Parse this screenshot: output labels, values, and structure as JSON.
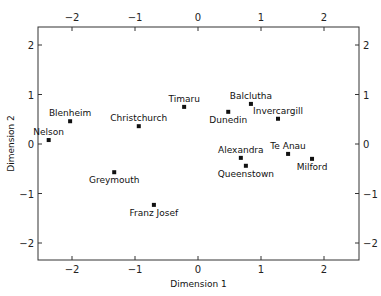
{
  "chart_data": {
    "type": "scatter",
    "title": "",
    "xlabel": "Dimension 1",
    "ylabel": "Dimension 2",
    "xlim": [
      -2.6,
      2.6
    ],
    "ylim": [
      -2.35,
      2.35
    ],
    "grid": false,
    "legend": null,
    "x_ticks": [
      -2,
      -1,
      0,
      1,
      2
    ],
    "y_ticks": [
      2,
      1,
      0,
      -1,
      -2
    ],
    "x_tick_labels": [
      "−2",
      "−1",
      "0",
      "1",
      "2"
    ],
    "y_tick_labels": [
      "2",
      "1",
      "0",
      "−1",
      "−2"
    ],
    "ticks_mirrored": true,
    "points": [
      {
        "label": "Nelson",
        "x": -2.37,
        "y": 0.08,
        "label_pos": "above"
      },
      {
        "label": "Blenheim",
        "x": -2.03,
        "y": 0.46,
        "label_pos": "above"
      },
      {
        "label": "Christchurch",
        "x": -0.94,
        "y": 0.36,
        "label_pos": "above"
      },
      {
        "label": "Timaru",
        "x": -0.22,
        "y": 0.75,
        "label_pos": "above"
      },
      {
        "label": "Dunedin",
        "x": 0.48,
        "y": 0.65,
        "label_pos": "below"
      },
      {
        "label": "Balclutha",
        "x": 0.84,
        "y": 0.81,
        "label_pos": "above"
      },
      {
        "label": "Invercargill",
        "x": 1.27,
        "y": 0.51,
        "label_pos": "above"
      },
      {
        "label": "Alexandra",
        "x": 0.68,
        "y": -0.28,
        "label_pos": "above"
      },
      {
        "label": "Queenstown",
        "x": 0.76,
        "y": -0.44,
        "label_pos": "below"
      },
      {
        "label": "Te Anau",
        "x": 1.43,
        "y": -0.2,
        "label_pos": "above"
      },
      {
        "label": "Milford",
        "x": 1.81,
        "y": -0.3,
        "label_pos": "below"
      },
      {
        "label": "Greymouth",
        "x": -1.33,
        "y": -0.57,
        "label_pos": "below"
      },
      {
        "label": "Franz Josef",
        "x": -0.7,
        "y": -1.23,
        "label_pos": "below"
      }
    ]
  },
  "layout": {
    "plot": {
      "left": 38,
      "top": 27,
      "right": 359,
      "bottom": 260
    },
    "x_origin_px": 198,
    "x_scale_px": 63,
    "y_origin_px": 144,
    "y_scale_px": 49.5,
    "colors": {
      "frame": "#333333",
      "marker": "#111111",
      "text": "#111111"
    }
  }
}
